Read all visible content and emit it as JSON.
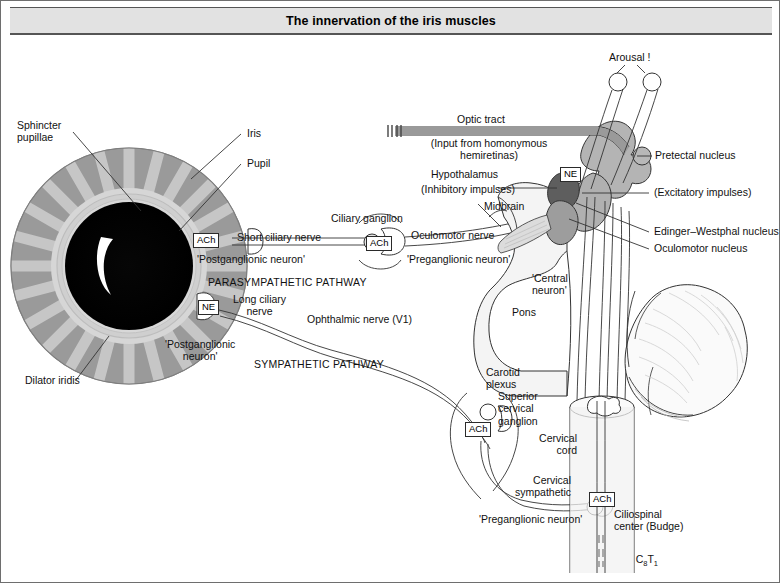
{
  "figure": {
    "title": "The innervation of the iris muscles",
    "border_color": "#6e6e6e",
    "title_bar_color": "#e2e2e2"
  },
  "eye": {
    "iris_outer_color": "#9a9a9a",
    "iris_spoke_color": "#c9c9c9",
    "pupil_color": "#000000",
    "labels": {
      "sphincter_pupillae": "Sphincter\npupillae",
      "iris": "Iris",
      "pupil": "Pupil",
      "dilator_iridis": "Dilator iridis"
    }
  },
  "parasympathetic": {
    "pathway_label": "PARASYMPATHETIC PATHWAY",
    "short_ciliary_nerve": "Short ciliary nerve",
    "postganglionic_neuron": "'Postganglionic neuron'",
    "ciliary_ganglion": "Ciliary ganglion",
    "preganglionic_neuron": "'Preganglionic neuron'",
    "oculomotor_nerve": "Oculomotor nerve",
    "transmitter_iris": "ACh",
    "transmitter_ganglion": "ACh"
  },
  "sympathetic": {
    "pathway_label": "SYMPATHETIC PATHWAY",
    "long_ciliary_nerve": "Long ciliary\nnerve",
    "postganglionic_neuron": "'Postganglionic\nneuron'",
    "ophthalmic_nerve": "Ophthalmic nerve (V1)",
    "carotid_plexus": "Carotid\nplexus",
    "superior_cervical_ganglion": "Superior\ncervical\nganglion",
    "cervical_sympathetic": "Cervical\nsympathetic",
    "preganglionic_neuron": "'Preganglionic neuron'",
    "transmitter_iris": "NE",
    "transmitter_ganglion": "ACh",
    "transmitter_cord": "ACh"
  },
  "brain": {
    "arousal": "Arousal !",
    "optic_tract": "Optic tract",
    "optic_tract_note": "(Input from homonymous\nhemiretinas)",
    "hypothalamus": "Hypothalamus",
    "hypothalamus_note": "(Inhibitory impulses)",
    "midbrain": "Midbrain",
    "pretectal_nucleus": "Pretectal nucleus",
    "excitatory_impulses": "(Excitatory impulses)",
    "edinger_westphal": "Edinger–Westphal nucleus",
    "oculomotor_nucleus": "Oculomotor nucleus",
    "central_neuron": "'Central\nneuron'",
    "pons": "Pons",
    "hypothalamus_transmitter": "NE"
  },
  "cord": {
    "cervical_cord": "Cervical\ncord",
    "ciliospinal_center": "Ciliospinal\ncenter (Budge)",
    "segments_c": "C",
    "segments_c_sub": "8",
    "segments_t": "T",
    "segments_t_sub": "1"
  }
}
